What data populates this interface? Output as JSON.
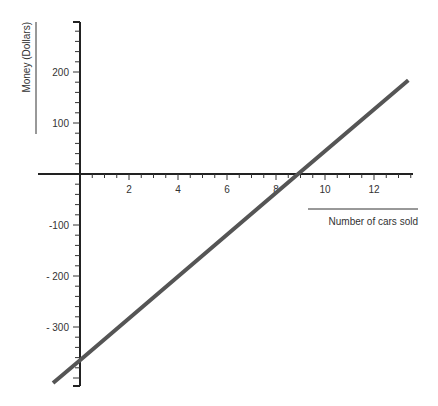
{
  "chart_data": {
    "type": "line",
    "title": "",
    "xlabel": "Number of cars sold",
    "ylabel": "Money (Dollars)",
    "x_ticks": [
      2,
      4,
      6,
      8,
      10,
      12
    ],
    "y_ticks": [
      200,
      100,
      -100,
      -200,
      -300
    ],
    "y_tick_labels": [
      "200",
      "100",
      "-100",
      "- 200",
      "- 300"
    ],
    "xlim": [
      -1.7,
      13.6
    ],
    "ylim": [
      -420,
      300
    ],
    "grid": false,
    "series": [
      {
        "name": "Money",
        "color": "#555555",
        "x": [
          -1.1,
          0,
          8.9,
          13.4
        ],
        "y": [
          -410,
          -365,
          0,
          184
        ]
      }
    ]
  }
}
